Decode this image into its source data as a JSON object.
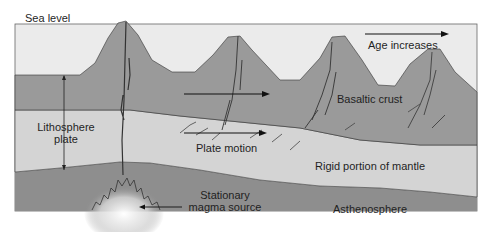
{
  "labels": {
    "sea_level": "Sea level",
    "age_increases": "Age increases",
    "basaltic_crust": "Basaltic crust",
    "lithosphere_line1": "Lithosphere",
    "lithosphere_line2": "plate",
    "plate_motion": "Plate motion",
    "rigid_mantle": "Rigid portion of mantle",
    "stationary_line1": "Stationary",
    "magma_source": "magma source",
    "asthenosphere": "Asthenosphere"
  },
  "colors": {
    "ocean": "#ebebeb",
    "crust": "#9a9a9a",
    "rigid_mantle": "#d4d4d4",
    "asthenosphere": "#8e8e8e",
    "lines": "#2a2a2a"
  }
}
